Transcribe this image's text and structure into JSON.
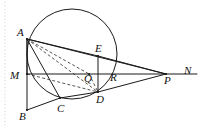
{
  "figure": {
    "type": "geometry-diagram",
    "width": 203,
    "height": 129,
    "background_color": "#ffffff",
    "stroke_color": "#1a1a1a",
    "margin_rule_color": "#c9c9c9",
    "circle": {
      "center": {
        "x": 72,
        "y": 54
      },
      "radius": 45
    },
    "points": {
      "A": {
        "x": 27,
        "y": 39,
        "label": "A",
        "label_x": 17,
        "label_y": 27
      },
      "B": {
        "x": 27,
        "y": 110,
        "label": "B",
        "label_x": 19,
        "label_y": 111
      },
      "C": {
        "x": 60,
        "y": 98,
        "label": "C",
        "label_x": 57,
        "label_y": 103
      },
      "D": {
        "x": 98,
        "y": 92,
        "label": "D",
        "label_x": 96,
        "label_y": 94
      },
      "E": {
        "x": 98,
        "y": 56,
        "label": "E",
        "label_x": 95,
        "label_y": 43
      },
      "M": {
        "x": 27,
        "y": 74,
        "label": "M",
        "label_x": 10,
        "label_y": 70
      },
      "N": {
        "x": 197,
        "y": 74,
        "label": "N",
        "label_x": 184,
        "label_y": 65
      },
      "P": {
        "x": 166,
        "y": 74,
        "label": "P",
        "label_x": 164,
        "label_y": 75
      },
      "Q": {
        "x": 89,
        "y": 74,
        "label": "Q",
        "label_x": 84,
        "label_y": 73
      },
      "R": {
        "x": 108,
        "y": 78,
        "label": "R",
        "label_x": 110,
        "label_y": 72
      }
    },
    "solid_segments": [
      {
        "name": "segment-A-B",
        "from": "A",
        "to": "B"
      },
      {
        "name": "segment-A-M",
        "from": "A",
        "to": "M"
      },
      {
        "name": "segment-A-C",
        "from": "A",
        "to": "C"
      },
      {
        "name": "segment-A-E",
        "from": "A",
        "to": "E"
      },
      {
        "name": "segment-A-P",
        "from": "A",
        "to": "P"
      },
      {
        "name": "segment-M-N",
        "from": "M",
        "to": "N"
      },
      {
        "name": "segment-B-C",
        "from": "B",
        "to": "C"
      },
      {
        "name": "segment-C-D",
        "from": "C",
        "to": "D"
      },
      {
        "name": "segment-D-P",
        "from": "D",
        "to": "P"
      },
      {
        "name": "segment-E-D",
        "from": "E",
        "to": "D"
      },
      {
        "name": "segment-E-P",
        "from": "E",
        "to": "P"
      }
    ],
    "dashed_segments": [
      {
        "name": "dashed-A-D",
        "from": "A",
        "to": "D"
      },
      {
        "name": "dashed-A-Q",
        "from": "A",
        "to": "Q"
      },
      {
        "name": "dashed-M-D",
        "from": "M",
        "to": "D"
      },
      {
        "name": "dashed-Q-D",
        "from": "Q",
        "to": "D"
      }
    ],
    "labels": [
      "A",
      "E",
      "M",
      "Q",
      "R",
      "P",
      "N",
      "B",
      "C",
      "D"
    ],
    "margin_rule": {
      "x": 5,
      "y1": 2,
      "y2": 127
    }
  }
}
